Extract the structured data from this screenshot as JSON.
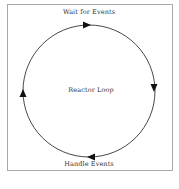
{
  "diagram": {
    "top_label": "Wait for Events",
    "center_label": "Reactor Loop",
    "bottom_label": "Handle Events",
    "direction": "clockwise",
    "colors": {
      "stroke": "#333333",
      "frame": "#a9a9a9",
      "text": "#333333"
    }
  }
}
